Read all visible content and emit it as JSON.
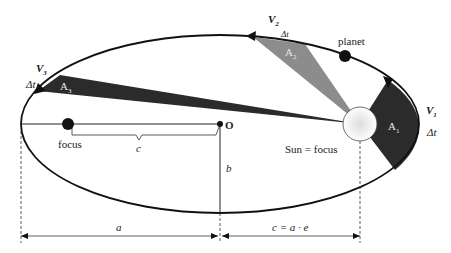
{
  "diagram": {
    "labels": {
      "v1": "V",
      "v1_sub": "1",
      "v2": "V",
      "v2_sub": "2",
      "v3": "V",
      "v3_sub": "3",
      "dt1": "Δt",
      "dt2": "Δt",
      "dt3": "Δt",
      "a1": "A",
      "a1_sub": "1",
      "a2": "A",
      "a2_sub": "2",
      "a3": "A",
      "a3_sub": "3",
      "planet": "planet",
      "sun": "Sun = focus",
      "focus": "focus",
      "center": "O",
      "c": "c",
      "b": "b",
      "a": "a",
      "c_eq": "c = a · e"
    },
    "colors": {
      "a1_fill": "#2b2b2b",
      "a2_fill": "#8c8c8c",
      "a3_fill": "#2b2b2b",
      "orbit": "#111111",
      "sun_fill": "#f4f4f4"
    }
  }
}
